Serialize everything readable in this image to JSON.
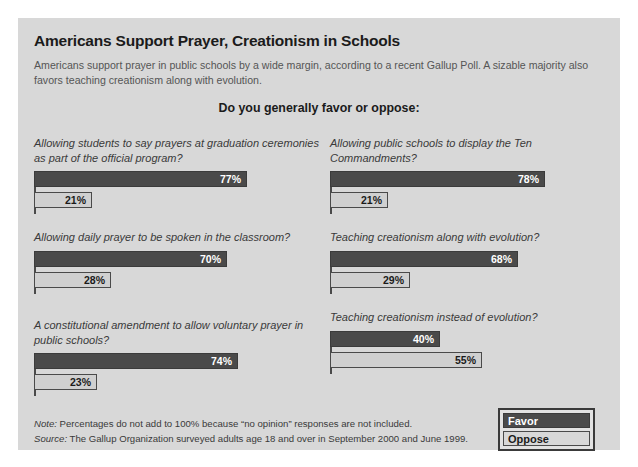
{
  "title": "Americans Support Prayer, Creationism in Schools",
  "subtitle": "Americans support prayer in public schools by a wide margin, according to a recent Gallup Poll. A sizable majority also favors teaching creationism along with evolution.",
  "heading": "Do you generally favor or oppose:",
  "legend": {
    "favor_label": "Favor",
    "oppose_label": "Oppose"
  },
  "notes": {
    "note_label": "Note:",
    "note_text": " Percentages do not add to 100% because “no opinion” responses are not included.",
    "source_label": "Source:",
    "source_text": " The Gallup Organization surveyed adults age 18 and over in September 2000 and June 1999."
  },
  "colors": {
    "panel_background": "#d8d8d8",
    "favor_bar": "#4a4a4a",
    "oppose_bar": "#d0d0d0",
    "bar_border": "#4a4a4a",
    "title_text": "#1b1b1b",
    "subtitle_text": "#555555"
  },
  "chart_data": {
    "type": "bar",
    "title": "Americans Support Prayer, Creationism in Schools",
    "subtitle": "Do you generally favor or oppose:",
    "orientation": "horizontal",
    "xlabel": "",
    "ylabel": "",
    "xlim": [
      0,
      100
    ],
    "grid": false,
    "legend_position": "bottom-right",
    "series": [
      {
        "name": "Favor",
        "values": [
          77,
          78,
          70,
          68,
          74,
          40
        ]
      },
      {
        "name": "Oppose",
        "values": [
          21,
          21,
          28,
          29,
          23,
          55
        ]
      }
    ],
    "categories": [
      "Allowing students to say prayers at graduation ceremonies as part of the official program?",
      "Allowing public schools to display the Ten Commandments?",
      "Allowing daily prayer to be spoken in the classroom?",
      "Teaching creationism along with evolution?",
      "A constitutional amendment to allow voluntary prayer in public schools?",
      "Teaching creationism instead of evolution?"
    ],
    "items": [
      {
        "question": "Allowing students to say prayers at graduation ceremonies as part of the official program?",
        "favor": 77,
        "oppose": 21,
        "favor_label": "77%",
        "oppose_label": "21%",
        "column": "left",
        "row": 1
      },
      {
        "question": "Allowing public schools to display the Ten Commandments?",
        "favor": 78,
        "oppose": 21,
        "favor_label": "78%",
        "oppose_label": "21%",
        "column": "right",
        "row": 1
      },
      {
        "question": "Allowing daily prayer to be spoken in the classroom?",
        "favor": 70,
        "oppose": 28,
        "favor_label": "70%",
        "oppose_label": "28%",
        "column": "left",
        "row": 2
      },
      {
        "question": "Teaching creationism along with evolution?",
        "favor": 68,
        "oppose": 29,
        "favor_label": "68%",
        "oppose_label": "29%",
        "column": "right",
        "row": 2
      },
      {
        "question": "A constitutional amendment to allow voluntary prayer in public schools?",
        "favor": 74,
        "oppose": 23,
        "favor_label": "74%",
        "oppose_label": "23%",
        "column": "left",
        "row": 3
      },
      {
        "question": "Teaching creationism instead of evolution?",
        "favor": 40,
        "oppose": 55,
        "favor_label": "40%",
        "oppose_label": "55%",
        "column": "right",
        "row": 3
      }
    ]
  }
}
